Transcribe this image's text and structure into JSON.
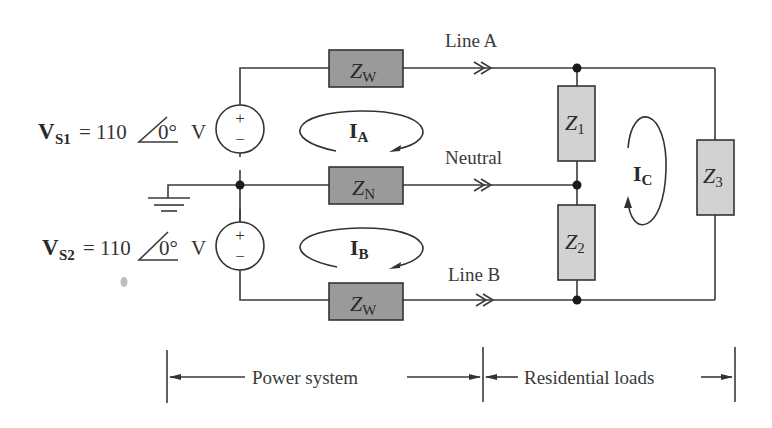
{
  "diagram": {
    "type": "three-wire residential power distribution circuit",
    "sources": [
      {
        "id": "VS1",
        "symbol": "V",
        "subscript": "S1",
        "equation": "= 110",
        "angle": "0°",
        "unit": "V",
        "polarity_top": "+",
        "polarity_bottom": "−"
      },
      {
        "id": "VS2",
        "symbol": "V",
        "subscript": "S2",
        "equation": "= 110",
        "angle": "0°",
        "unit": "V",
        "polarity_top": "+",
        "polarity_bottom": "−"
      }
    ],
    "impedances": [
      {
        "id": "ZW_top",
        "base": "Z",
        "sub": "W",
        "shade": "dark"
      },
      {
        "id": "ZN",
        "base": "Z",
        "sub": "N",
        "shade": "dark"
      },
      {
        "id": "ZW_bottom",
        "base": "Z",
        "sub": "W",
        "shade": "dark"
      },
      {
        "id": "Z1",
        "base": "Z",
        "sub": "1",
        "shade": "light"
      },
      {
        "id": "Z2",
        "base": "Z",
        "sub": "2",
        "shade": "light"
      },
      {
        "id": "Z3",
        "base": "Z",
        "sub": "3",
        "shade": "light"
      }
    ],
    "lines": [
      {
        "id": "lineA",
        "label": "Line A"
      },
      {
        "id": "neutral",
        "label": "Neutral"
      },
      {
        "id": "lineB",
        "label": "Line B"
      }
    ],
    "mesh_currents": [
      {
        "id": "IA",
        "symbol": "I",
        "sub": "A",
        "direction": "clockwise"
      },
      {
        "id": "IB",
        "symbol": "I",
        "sub": "B",
        "direction": "clockwise"
      },
      {
        "id": "IC",
        "symbol": "I",
        "sub": "C",
        "direction": "counterclockwise"
      }
    ],
    "sections": [
      {
        "id": "power-system",
        "label": "Power system"
      },
      {
        "id": "residential-loads",
        "label": "Residential loads"
      }
    ],
    "ground": {
      "label": "ground-symbol"
    }
  }
}
